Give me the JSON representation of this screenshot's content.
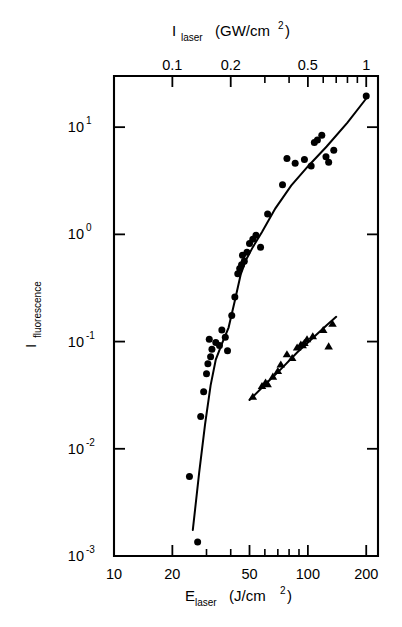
{
  "figure": {
    "background": "#ffffff",
    "ink": "#000000"
  },
  "chart_data": {
    "type": "scatter",
    "title": "",
    "subtitle": "",
    "xlabel": "E_laser (J/cm^2)",
    "xlabel_base": "E",
    "xlabel_sub": "laser",
    "xlabel_units": "(J/cm",
    "xlabel_units_sup": "2",
    "xlabel_units_close": ")",
    "ylabel": "I_fluorescence",
    "ylabel_base": "I",
    "ylabel_sub": "fluorescence",
    "x2label": "I_laser (GW/cm^2)",
    "x2label_base": "I",
    "x2label_sub": "laser",
    "x2label_units": "(GW/cm",
    "x2label_units_sup": "2",
    "x2label_units_close": ")",
    "xscale": "log",
    "yscale": "log",
    "x2scale": "log",
    "xlim": [
      10,
      230
    ],
    "ylim": [
      0.001,
      30
    ],
    "x2lim": [
      0.05,
      1.15
    ],
    "grid": false,
    "legend": "none",
    "xticks": [
      10,
      20,
      50,
      100,
      200
    ],
    "xticklabels": [
      "10",
      "20",
      "50",
      "100",
      "200"
    ],
    "xticks_minor": [
      30,
      40,
      60,
      70,
      80,
      90
    ],
    "yticks": [
      0.001,
      0.01,
      0.1,
      1,
      10
    ],
    "yticklabels": [
      "10-3",
      "10-2",
      "10-1",
      "100",
      "101"
    ],
    "ytick_mantissa": "10",
    "ytick_exponents": [
      "-3",
      "-2",
      "-1",
      "0",
      "1"
    ],
    "x2ticks": [
      0.1,
      0.2,
      0.5,
      1
    ],
    "x2ticklabels": [
      "0.1",
      "0.2",
      "0.5",
      "1"
    ],
    "x2ticks_minor": [
      0.3,
      0.4,
      0.6,
      0.7,
      0.8,
      0.9
    ],
    "series": [
      {
        "name": "circles",
        "marker": "circle",
        "marker_size": 7.0,
        "points": [
          [
            24.5,
            0.0055
          ],
          [
            27.0,
            0.00135
          ],
          [
            28.0,
            0.02
          ],
          [
            29.0,
            0.034
          ],
          [
            30.0,
            0.05
          ],
          [
            30.5,
            0.062
          ],
          [
            31.5,
            0.072
          ],
          [
            32.0,
            0.085
          ],
          [
            31.0,
            0.105
          ],
          [
            33.5,
            0.098
          ],
          [
            35.0,
            0.092
          ],
          [
            37.5,
            0.11
          ],
          [
            36.0,
            0.128
          ],
          [
            38.5,
            0.082
          ],
          [
            40.5,
            0.175
          ],
          [
            42.0,
            0.26
          ],
          [
            43.5,
            0.43
          ],
          [
            44.5,
            0.48
          ],
          [
            45.5,
            0.52
          ],
          [
            47.0,
            0.56
          ],
          [
            46.0,
            0.64
          ],
          [
            48.5,
            0.68
          ],
          [
            50.0,
            0.82
          ],
          [
            52.0,
            0.9
          ],
          [
            54.0,
            0.98
          ],
          [
            57.0,
            0.76
          ],
          [
            62.0,
            1.55
          ],
          [
            74.0,
            2.9
          ],
          [
            78.0,
            5.1
          ],
          [
            86.0,
            4.6
          ],
          [
            96.0,
            5.0
          ],
          [
            104.0,
            4.35
          ],
          [
            108.0,
            7.2
          ],
          [
            112.0,
            7.6
          ],
          [
            118.0,
            8.4
          ],
          [
            124.0,
            5.3
          ],
          [
            128.0,
            4.7
          ],
          [
            136.0,
            6.1
          ],
          [
            200.0,
            19.5
          ]
        ]
      },
      {
        "name": "triangles",
        "marker": "triangle",
        "marker_size": 7.5,
        "points": [
          [
            52.0,
            0.0305
          ],
          [
            58.0,
            0.0385
          ],
          [
            60.5,
            0.0415
          ],
          [
            62.0,
            0.04
          ],
          [
            66.0,
            0.047
          ],
          [
            70.0,
            0.053
          ],
          [
            72.5,
            0.061
          ],
          [
            78.0,
            0.076
          ],
          [
            83.0,
            0.07
          ],
          [
            88.0,
            0.088
          ],
          [
            92.0,
            0.0935
          ],
          [
            94.0,
            0.092
          ],
          [
            96.0,
            0.097
          ],
          [
            99.0,
            0.105
          ],
          [
            106.0,
            0.112
          ],
          [
            120.0,
            0.128
          ],
          [
            128.0,
            0.09
          ],
          [
            134.0,
            0.146
          ]
        ]
      }
    ],
    "fit_curves": [
      {
        "name": "circles-fit",
        "points": [
          [
            25.5,
            0.00175
          ],
          [
            27.5,
            0.006
          ],
          [
            29.5,
            0.017
          ],
          [
            31.5,
            0.039
          ],
          [
            33.5,
            0.068
          ],
          [
            36.0,
            0.095
          ],
          [
            39.0,
            0.135
          ],
          [
            42.0,
            0.24
          ],
          [
            45.0,
            0.42
          ],
          [
            48.0,
            0.58
          ],
          [
            52.0,
            0.76
          ],
          [
            58.0,
            1.05
          ],
          [
            68.0,
            1.75
          ],
          [
            82.0,
            2.85
          ],
          [
            100.0,
            4.3
          ],
          [
            125.0,
            6.6
          ],
          [
            160.0,
            11.0
          ],
          [
            200.0,
            18.5
          ]
        ]
      },
      {
        "name": "triangles-fit",
        "points": [
          [
            50.0,
            0.0285
          ],
          [
            60.0,
            0.0395
          ],
          [
            72.0,
            0.0545
          ],
          [
            88.0,
            0.079
          ],
          [
            105.0,
            0.106
          ],
          [
            125.0,
            0.142
          ],
          [
            140.0,
            0.17
          ]
        ]
      }
    ]
  }
}
